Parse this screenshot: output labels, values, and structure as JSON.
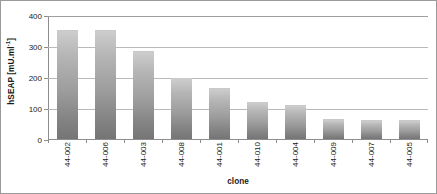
{
  "chart_data": {
    "type": "bar",
    "title": "",
    "xlabel": "clone",
    "ylabel": "hSEAP [mU.ml-1]",
    "ylabel_base": "hSEAP [mU.ml",
    "ylabel_sup": "-1",
    "ylabel_tail": "]",
    "categories": [
      "44-002",
      "44-006",
      "44-003",
      "44-008",
      "44-001",
      "44-010",
      "44-004",
      "44-009",
      "44-007",
      "44-005"
    ],
    "values": [
      352,
      352,
      285,
      198,
      163,
      119,
      111,
      65,
      62,
      61
    ],
    "ylim": [
      0,
      400
    ],
    "yticks": [
      0,
      100,
      200,
      300,
      400
    ],
    "ytick_labels": [
      "0",
      "100",
      "200",
      "300",
      "400"
    ],
    "grid": true,
    "legend": "none",
    "bar_color": "#9d9d9d",
    "grid_color": "#b9b9b9",
    "axis_color": "#8d8d8d",
    "background": "#ffffff"
  }
}
